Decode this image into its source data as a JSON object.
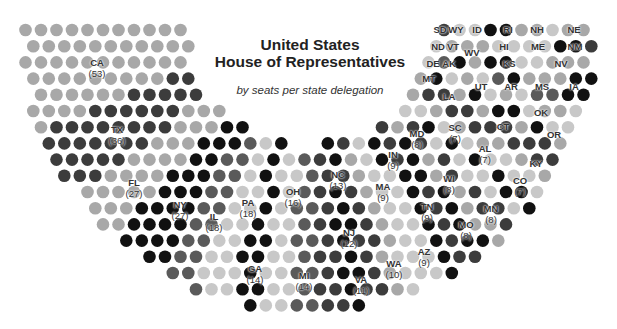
{
  "chart_data": {
    "type": "parliament",
    "title": "United States\nHouse of Representatives",
    "title_line1": "United States",
    "title_line2": "House of Representatives",
    "subtitle": "by seats per state delegation",
    "total_seats": 435,
    "shades": {
      "light": "#c8c8c8",
      "mid": "#a8a8a8",
      "dark": "#5a5a5a",
      "darker": "#3c3c3c",
      "black": "#111111"
    },
    "states": [
      {
        "code": "CA",
        "seats": 53,
        "shade": "mid",
        "label_x": 97,
        "label_y": 68
      },
      {
        "code": "TX",
        "seats": 36,
        "shade": "darker",
        "label_x": 117,
        "label_y": 135
      },
      {
        "code": "FL",
        "seats": 27,
        "shade": "mid",
        "label_x": 134,
        "label_y": 188
      },
      {
        "code": "NY",
        "seats": 27,
        "shade": "black",
        "label_x": 180,
        "label_y": 210
      },
      {
        "code": "IL",
        "seats": 18,
        "shade": "dark",
        "label_x": 214,
        "label_y": 222
      },
      {
        "code": "PA",
        "seats": 18,
        "shade": "light",
        "label_x": 248,
        "label_y": 208
      },
      {
        "code": "GA",
        "seats": 14,
        "shade": "black",
        "label_x": 255,
        "label_y": 274
      },
      {
        "code": "OH",
        "seats": 16,
        "shade": "light",
        "label_x": 293,
        "label_y": 197
      },
      {
        "code": "MI",
        "seats": 14,
        "shade": "dark",
        "label_x": 304,
        "label_y": 281
      },
      {
        "code": "NC",
        "seats": 13,
        "shade": "darker",
        "label_x": 338,
        "label_y": 180
      },
      {
        "code": "NJ",
        "seats": 12,
        "shade": "black",
        "label_x": 349,
        "label_y": 238
      },
      {
        "code": "VA",
        "seats": 11,
        "shade": "darker",
        "label_x": 361,
        "label_y": 285
      },
      {
        "code": "MA",
        "seats": 9,
        "shade": "mid",
        "label_x": 383,
        "label_y": 192
      },
      {
        "code": "WA",
        "seats": 10,
        "shade": "light",
        "label_x": 394,
        "label_y": 269
      },
      {
        "code": "IN",
        "seats": 9,
        "shade": "light",
        "label_x": 393,
        "label_y": 160
      },
      {
        "code": "TN",
        "seats": 9,
        "shade": "black",
        "label_x": 427,
        "label_y": 212
      },
      {
        "code": "AZ",
        "seats": 9,
        "shade": "darker",
        "label_x": 424,
        "label_y": 257
      },
      {
        "code": "MD",
        "seats": 8,
        "shade": "black",
        "label_x": 417,
        "label_y": 139
      },
      {
        "code": "WI",
        "seats": 8,
        "shade": "mid",
        "label_x": 449,
        "label_y": 184
      },
      {
        "code": "MO",
        "seats": 8,
        "shade": "darker",
        "label_x": 466,
        "label_y": 230
      },
      {
        "code": "SC",
        "seats": 7,
        "shade": "light",
        "label_x": 455,
        "label_y": 133
      },
      {
        "code": "AL",
        "seats": 7,
        "shade": "black",
        "label_x": 485,
        "label_y": 154
      },
      {
        "code": "MN",
        "seats": 8,
        "shade": "light",
        "label_x": 491,
        "label_y": 214
      },
      {
        "code": "CO",
        "seats": 7,
        "shade": "mid",
        "label_x": 520,
        "label_y": 186
      },
      {
        "code": "KY",
        "seats": 6,
        "shade": "darker",
        "label_x": 536,
        "label_y": 163
      },
      {
        "code": "LA",
        "seats": 6,
        "shade": "darker",
        "label_x": 449,
        "label_y": 96
      },
      {
        "code": "CT",
        "seats": 5,
        "shade": "mid",
        "label_x": 503,
        "label_y": 126
      },
      {
        "code": "OR",
        "seats": 5,
        "shade": "black",
        "label_x": 554,
        "label_y": 134
      },
      {
        "code": "OK",
        "seats": 5,
        "shade": "light",
        "label_x": 541,
        "label_y": 112
      },
      {
        "code": "UT",
        "seats": 4,
        "shade": "mid",
        "label_x": 481,
        "label_y": 86
      },
      {
        "code": "AR",
        "seats": 4,
        "shade": "light",
        "label_x": 511,
        "label_y": 86
      },
      {
        "code": "MS",
        "seats": 4,
        "shade": "dark",
        "label_x": 542,
        "label_y": 86
      },
      {
        "code": "IA",
        "seats": 4,
        "shade": "black",
        "label_x": 574,
        "label_y": 86
      },
      {
        "code": "NV",
        "seats": 4,
        "shade": "mid",
        "label_x": 561,
        "label_y": 63
      },
      {
        "code": "KS",
        "seats": 4,
        "shade": "black",
        "label_x": 509,
        "label_y": 63
      },
      {
        "code": "NM",
        "seats": 3,
        "shade": "light",
        "label_x": 575,
        "label_y": 46
      },
      {
        "code": "NE",
        "seats": 3,
        "shade": "mid",
        "label_x": 574,
        "label_y": 29
      },
      {
        "code": "WV",
        "seats": 3,
        "shade": "mid",
        "label_x": 472,
        "label_y": 52
      },
      {
        "code": "ID",
        "seats": 2,
        "shade": "light",
        "label_x": 477,
        "label_y": 29
      },
      {
        "code": "MT",
        "seats": 2,
        "shade": "light",
        "label_x": 429,
        "label_y": 78
      },
      {
        "code": "HI",
        "seats": 2,
        "shade": "black",
        "label_x": 504,
        "label_y": 46
      },
      {
        "code": "ME",
        "seats": 2,
        "shade": "darker",
        "label_x": 538,
        "label_y": 46
      },
      {
        "code": "NH",
        "seats": 2,
        "shade": "light",
        "label_x": 537,
        "label_y": 29
      },
      {
        "code": "RI",
        "seats": 2,
        "shade": "black",
        "label_x": 508,
        "label_y": 29
      },
      {
        "code": "AK",
        "seats": 1,
        "shade": "mid",
        "label_x": 449,
        "label_y": 63
      },
      {
        "code": "DE",
        "seats": 1,
        "shade": "mid",
        "label_x": 433,
        "label_y": 63
      },
      {
        "code": "ND",
        "seats": 1,
        "shade": "light",
        "label_x": 438,
        "label_y": 46
      },
      {
        "code": "SD",
        "seats": 1,
        "shade": "mid",
        "label_x": 440,
        "label_y": 29
      },
      {
        "code": "VT",
        "seats": 1,
        "shade": "mid",
        "label_x": 453,
        "label_y": 46
      },
      {
        "code": "WY",
        "seats": 1,
        "shade": "darker",
        "label_x": 456,
        "label_y": 29
      }
    ],
    "labeled_with_counts": [
      "CA",
      "TX",
      "FL",
      "NY",
      "IL",
      "PA",
      "GA",
      "OH",
      "MI",
      "NC",
      "NJ",
      "VA",
      "MA",
      "WA",
      "IN",
      "TN",
      "AZ",
      "MD",
      "WI",
      "MO",
      "SC",
      "AL",
      "MN",
      "CO"
    ],
    "layout": {
      "center_x": 308,
      "center_y": 22,
      "r_inner": 122,
      "r_outer": 290,
      "dot_radius": 6.3,
      "pitch_x": 15.5,
      "pitch_y": 16.2,
      "y_min": 24
    }
  }
}
